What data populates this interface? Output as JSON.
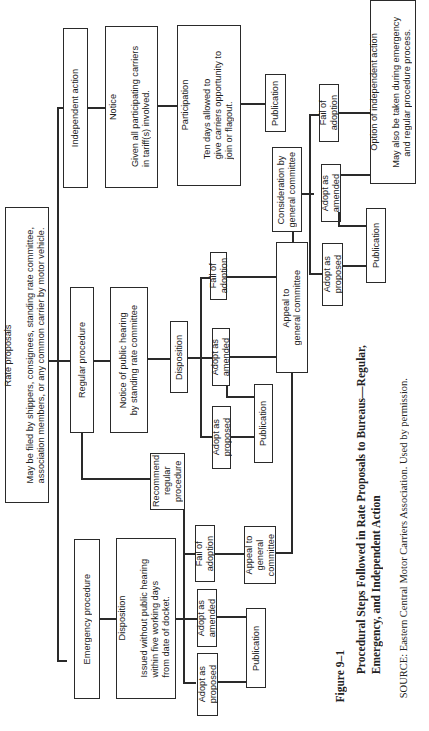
{
  "diagram": {
    "orientation": "rotated 90deg counter-clockwise (text reads bottom-to-top)",
    "root": {
      "title": "Rate proposals",
      "body": "May be filed by shippers, consignees, standing rate committee,\nassociation members, or any common carrier by motor vehicle."
    },
    "independent": {
      "label": "Independent action",
      "notice_title": "Notice",
      "notice_body": "Given all participating carriers\nin tariff(s) involved.",
      "participation_title": "Participation",
      "participation_body": "Ten days allowed to\ngive carriers opportunity to\njoin or flagout.",
      "publication": "Publication"
    },
    "regular": {
      "label": "Regular procedure",
      "notice": "Notice of public hearing\nby standing rate committee",
      "disposition": "Disposition",
      "fail": "Fail of\nadoption",
      "amended": "Adopt as\namended",
      "proposed": "Adopt as\nproposed",
      "publication": "Publication",
      "appeal": "Appeal to\ngeneral committee",
      "recommend": "Recommend\nregular\nprocedure"
    },
    "general": {
      "consideration": "Consideration by\ngeneral committee",
      "fail": "Fail of\nadoption",
      "amended": "Adopt as\namended",
      "proposed": "Adopt as\nproposed",
      "publication": "Publication",
      "option_title": "Option of independent action",
      "option_body": "May also be taken during emergency\nand regular procedure process."
    },
    "emergency": {
      "label": "Emergency procedure",
      "disposition_title": "Disposition",
      "disposition_body": "Issued without public hearing\nwithin five working days\nfrom date of docket.",
      "fail": "Fail of\nadoption",
      "amended": "Adopt as\namended",
      "proposed": "Adopt as\nproposed",
      "publication": "Publication",
      "appeal": "Appeal to\ngeneral\ncommittee"
    }
  },
  "caption": {
    "figure": "Figure 9–1",
    "title": "Procedural Steps Followed in Rate Proposals to Bureaus—Regular,\nEmergency, and Independent Action",
    "source": "SOURCE: Eastern Central Motor Carriers Association. Used by permission."
  }
}
